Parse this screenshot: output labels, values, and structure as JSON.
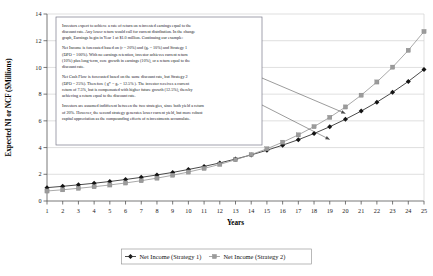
{
  "chart_data": {
    "type": "line",
    "title": "",
    "xlabel": "Years",
    "ylabel": "Expected NI or NCF ($Millions)",
    "xlim": [
      1,
      25
    ],
    "ylim": [
      0,
      14
    ],
    "ytick_step": 2,
    "grid": true,
    "legend_position": "bottom",
    "x": [
      1,
      2,
      3,
      4,
      5,
      6,
      7,
      8,
      9,
      10,
      11,
      12,
      13,
      14,
      15,
      16,
      17,
      18,
      19,
      20,
      21,
      22,
      23,
      24,
      25
    ],
    "xticklabels": [
      "1",
      "2",
      "3",
      "4",
      "5",
      "6",
      "7",
      "8",
      "9",
      "10",
      "11",
      "12",
      "13",
      "14",
      "15",
      "16",
      "17",
      "18",
      "19",
      "20",
      "21",
      "22",
      "23",
      "24",
      "25"
    ],
    "yticklabels": [
      "0",
      "2",
      "4",
      "6",
      "8",
      "10",
      "12",
      "14"
    ],
    "series": [
      {
        "name": "Net Income (Strategy 1)",
        "marker": "diamond",
        "color": "#2b2b2b",
        "values": [
          1.0,
          1.1,
          1.21,
          1.33,
          1.46,
          1.61,
          1.77,
          1.95,
          2.14,
          2.36,
          2.59,
          2.85,
          3.14,
          3.45,
          3.8,
          4.18,
          4.59,
          5.05,
          5.56,
          6.12,
          6.73,
          7.4,
          8.14,
          8.95,
          9.85
        ]
      },
      {
        "name": "Net Income (Strategy 2)",
        "marker": "square",
        "color": "#9a9a9a",
        "values": [
          0.75,
          0.84,
          0.95,
          1.07,
          1.2,
          1.35,
          1.52,
          1.71,
          1.93,
          2.17,
          2.44,
          2.74,
          3.09,
          3.47,
          3.91,
          4.4,
          4.95,
          5.57,
          6.26,
          7.04,
          7.92,
          8.91,
          10.02,
          11.28,
          12.69
        ]
      }
    ],
    "annotations": [
      {
        "name": "strategy-1-pointer",
        "note": "leader line from note box to Net Income (Strategy 1) curve"
      },
      {
        "name": "strategy-2-pointer",
        "note": "leader line from note box to Net Income (Strategy 2) curve"
      }
    ]
  },
  "note_box": {
    "paragraphs": [
      [
        "Investors expect to achieve a rate of return on reinvested earnings equal to the",
        "discount rate. Any lower return would call for current distribution. In the change",
        "graph, Earnings begin in Year 1 at $1.0 million. Continuing our example:"
      ],
      [
        "Net Income is forecasted based on (r = 20%) and (gₑ = 10%) and Strategy 1",
        "(DPO = 100%). With no earnings retention, investor achieves current return",
        "(10%) plus long-term, core growth in earnings (10%), or a return equal to the",
        "discount rate."
      ],
      [
        "Net Cash Flow is forecasted based on the same discount rate, but Strategy 2",
        "(DPO = 25%). Therefore ( g* = gₑ = 12.5% ). The investor receives a current",
        "return of 7.5%, but is compensated with higher future growth (12.5%), thereby",
        "achieving a return equal to the discount rate."
      ],
      [
        "Investors are assumed indifferent between the two strategies, since both yield a return",
        "of 20%. However, the second strategy generates lower current yield, but more robust",
        "capital appreciation as the compounding effects of reinvestments accumulate."
      ]
    ]
  },
  "legend": {
    "items": [
      {
        "label": "Net Income (Strategy 1)",
        "marker": "diamond",
        "color": "#2b2b2b"
      },
      {
        "label": "Net Income (Strategy 2)",
        "marker": "square",
        "color": "#9a9a9a"
      }
    ]
  }
}
